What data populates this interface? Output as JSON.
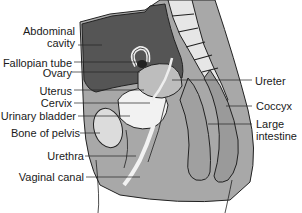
{
  "figure": {
    "labels_left": [
      {
        "id": "abdominal-cavity",
        "text": "Abdominal",
        "text2": "cavity"
      },
      {
        "id": "fallopian-tube",
        "text": "Fallopian tube"
      },
      {
        "id": "ovary",
        "text": "Ovary"
      },
      {
        "id": "uterus",
        "text": "Uterus"
      },
      {
        "id": "cervix",
        "text": "Cervix"
      },
      {
        "id": "urinary-bladder",
        "text": "Urinary bladder"
      },
      {
        "id": "bone-of-pelvis",
        "text": "Bone of pelvis"
      },
      {
        "id": "urethra",
        "text": "Urethra"
      },
      {
        "id": "vaginal-canal",
        "text": "Vaginal canal"
      }
    ],
    "labels_right": [
      {
        "id": "ureter",
        "text": "Ureter"
      },
      {
        "id": "coccyx",
        "text": "Coccyx"
      },
      {
        "id": "large-intestine",
        "text": "Large",
        "text2": "intestine"
      }
    ],
    "colors": {
      "cavity": "#5a5a5a",
      "tissue": "#a8a8a8",
      "bone": "#e6e6e6",
      "outline": "#222222",
      "light": "#f2f2f2"
    }
  }
}
